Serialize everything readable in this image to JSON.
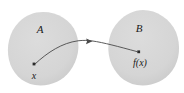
{
  "figure": {
    "kind": "function-mapping-diagram",
    "width": 184,
    "height": 93,
    "background_color": "#ffffff"
  },
  "colors": {
    "blob_fill": "#d4d4d4",
    "blob_fill_edge": "#cccccc",
    "arrow_stroke": "#4a4a4a",
    "point_fill": "#2b2b2b",
    "text_color": "#1a1a1a"
  },
  "sets": [
    {
      "id": "domain",
      "label": "A",
      "label_x": 40,
      "label_y": 33,
      "center_x": 43,
      "center_y": 48
    },
    {
      "id": "codomain",
      "label": "B",
      "label_x": 139,
      "label_y": 32,
      "center_x": 143,
      "center_y": 48
    }
  ],
  "points": [
    {
      "id": "preimage",
      "label": "x",
      "dot_x": 34,
      "dot_y": 64,
      "label_x": 34,
      "label_y": 79
    },
    {
      "id": "image",
      "label": "f(x)",
      "dot_x": 139,
      "dot_y": 52,
      "label_x": 140,
      "label_y": 66
    }
  ],
  "arrow": {
    "id": "mapping-arrow",
    "from": "x",
    "to": "f(x)",
    "head_x": 90,
    "head_y": 41,
    "stroke_width": 0.9
  }
}
